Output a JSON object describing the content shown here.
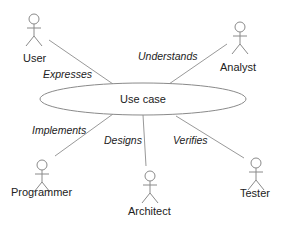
{
  "diagram": {
    "type": "uml-use-case",
    "use_case": {
      "label": "Use case",
      "cx": 143,
      "cy": 99,
      "rx": 103,
      "ry": 16
    },
    "actors": [
      {
        "name": "User",
        "x": 34,
        "y": 14,
        "label_x": 23,
        "label_y": 62
      },
      {
        "name": "Analyst",
        "x": 240,
        "y": 22,
        "label_x": 220,
        "label_y": 71
      },
      {
        "name": "Programmer",
        "x": 42,
        "y": 160,
        "label_x": 11,
        "label_y": 196
      },
      {
        "name": "Architect",
        "x": 150,
        "y": 171,
        "label_x": 128,
        "label_y": 215
      },
      {
        "name": "Tester",
        "x": 256,
        "y": 158,
        "label_x": 240,
        "label_y": 197
      }
    ],
    "relations": [
      {
        "label": "Expresses",
        "x1": 49,
        "y1": 40,
        "x2": 113,
        "y2": 84,
        "lx": 43,
        "ly": 78
      },
      {
        "label": "Understands",
        "x1": 227,
        "y1": 44,
        "x2": 169,
        "y2": 84,
        "lx": 138,
        "ly": 60
      },
      {
        "label": "Implements",
        "x1": 55,
        "y1": 156,
        "x2": 113,
        "y2": 114,
        "lx": 32,
        "ly": 134
      },
      {
        "label": "Designs",
        "x1": 146,
        "y1": 166,
        "x2": 143,
        "y2": 115,
        "lx": 104,
        "ly": 144
      },
      {
        "label": "Verifies",
        "x1": 244,
        "y1": 158,
        "x2": 176,
        "y2": 116,
        "lx": 173,
        "ly": 144
      }
    ]
  },
  "colors": {
    "stroke": "#8a8a8a",
    "text": "#222222",
    "background": "#ffffff"
  }
}
